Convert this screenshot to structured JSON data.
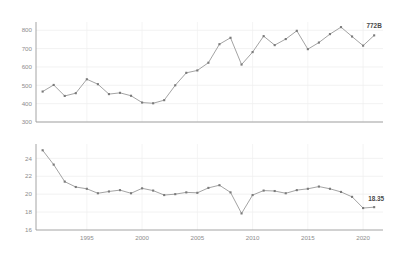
{
  "figure": {
    "background": "#ffffff",
    "line_color": "#999999",
    "marker_color": "#7a7a7a",
    "grid_color": "#ececec",
    "axis_color": "#9a9a9a",
    "label_color": "#8d8d8d",
    "annotation_color": "#4a4a4a"
  },
  "chart_data": [
    {
      "type": "line",
      "panel": "top",
      "title": "",
      "xlabel": "",
      "ylabel": "",
      "xlim": [
        1990.4,
        2021.8
      ],
      "ylim": [
        300,
        845
      ],
      "grid": true,
      "legend": "none",
      "yticks": [
        300,
        400,
        500,
        600,
        700,
        800
      ],
      "ytick_labels": [
        "300",
        "400",
        "500",
        "600",
        "700",
        "800"
      ],
      "xticks": [
        1995,
        2000,
        2005,
        2010,
        2015,
        2020
      ],
      "xtick_labels": [
        "1995",
        "2000",
        "2005",
        "2010",
        "2015",
        "2020"
      ],
      "x": [
        1991,
        1992,
        1993,
        1994,
        1995,
        1996,
        1997,
        1998,
        1999,
        2000,
        2001,
        2002,
        2003,
        2004,
        2005,
        2006,
        2007,
        2008,
        2009,
        2010,
        2011,
        2012,
        2013,
        2014,
        2015,
        2016,
        2017,
        2018,
        2019,
        2020,
        2021
      ],
      "values": [
        466,
        502,
        442,
        457,
        533,
        506,
        452,
        459,
        443,
        406,
        402,
        419,
        500,
        568,
        581,
        623,
        724,
        759,
        613,
        681,
        768,
        719,
        752,
        797,
        697,
        733,
        779,
        817,
        766,
        716,
        772
      ],
      "annotations": [
        {
          "x": 2021,
          "y": 772,
          "text": "772B"
        }
      ]
    },
    {
      "type": "line",
      "panel": "bottom",
      "title": "",
      "xlabel": "",
      "ylabel": "",
      "xlim": [
        1990.4,
        2021.8
      ],
      "ylim": [
        16,
        25.6
      ],
      "grid": true,
      "legend": "none",
      "yticks": [
        16,
        18,
        20,
        22,
        24
      ],
      "ytick_labels": [
        "16",
        "18",
        "20",
        "22",
        "24"
      ],
      "xticks": [
        1995,
        2000,
        2005,
        2010,
        2015,
        2020
      ],
      "xtick_labels": [
        "1995",
        "2000",
        "2005",
        "2010",
        "2015",
        "2020"
      ],
      "x": [
        1991,
        1992,
        1993,
        1994,
        1995,
        1996,
        1997,
        1998,
        1999,
        2000,
        2001,
        2002,
        2003,
        2004,
        2005,
        2006,
        2007,
        2008,
        2009,
        2010,
        2011,
        2012,
        2013,
        2014,
        2015,
        2016,
        2017,
        2018,
        2019,
        2020,
        2021
      ],
      "values": [
        24.9,
        23.3,
        21.4,
        20.8,
        20.6,
        20.1,
        20.3,
        20.45,
        20.1,
        20.65,
        20.4,
        19.9,
        20.0,
        20.2,
        20.15,
        20.7,
        21.0,
        20.2,
        17.85,
        19.9,
        20.4,
        20.35,
        20.1,
        20.45,
        20.6,
        20.85,
        20.6,
        20.25,
        19.7,
        18.45,
        18.55
      ],
      "annotations": [
        {
          "x": 2021,
          "y": 18.55,
          "text": "18.35"
        }
      ]
    }
  ]
}
